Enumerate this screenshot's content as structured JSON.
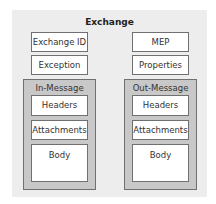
{
  "diagram": {
    "title": "Exchange",
    "left_column": {
      "fields": [
        "Exchange ID",
        "Exception"
      ],
      "message": {
        "title": "In-Message",
        "parts": [
          "Headers",
          "Attachments",
          "Body"
        ]
      }
    },
    "right_column": {
      "fields": [
        "MEP",
        "Properties"
      ],
      "message": {
        "title": "Out-Message",
        "parts": [
          "Headers",
          "Attachments",
          "Body"
        ]
      }
    },
    "colors": {
      "outer_background": "#ededed",
      "message_container": "#c8c8c8",
      "box_fill": "#ffffff",
      "border": "#707070"
    }
  }
}
